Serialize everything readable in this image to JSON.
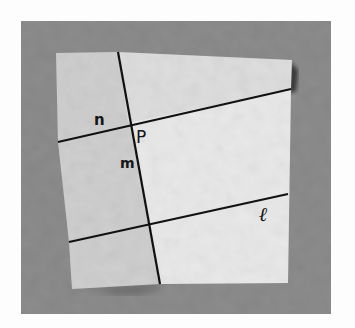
{
  "image": {
    "description": "Photograph of a folded square sheet of paper on a gray board, with fold lines drawn and labeled",
    "labels": {
      "n": "n",
      "P": "P",
      "m": "m",
      "l": "ℓ"
    }
  },
  "colors": {
    "outer_background": "#fdfdfd",
    "board": "#8c8c8c",
    "paper_main": "#e9e9e9",
    "paper_left_flap": "#cfcfcf",
    "paper_top_flap": "#dcdcdc",
    "line": "#111111"
  }
}
